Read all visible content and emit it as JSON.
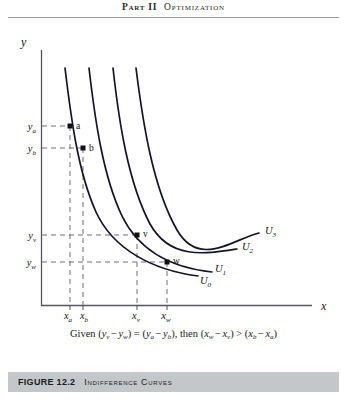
{
  "running_head": {
    "part": "Part II",
    "chapter": "Optimization"
  },
  "figure": {
    "axis_label_x": "x",
    "axis_label_y": "y",
    "y_ticks": [
      {
        "id": "ya",
        "base": "y",
        "sub": "a",
        "py": 126
      },
      {
        "id": "yb",
        "base": "y",
        "sub": "b",
        "py": 148
      },
      {
        "id": "yv",
        "base": "y",
        "sub": "v",
        "py": 235
      },
      {
        "id": "yw",
        "base": "y",
        "sub": "w",
        "py": 262
      }
    ],
    "x_ticks": [
      {
        "id": "xa",
        "base": "x",
        "sub": "a",
        "px": 70
      },
      {
        "id": "xb",
        "base": "x",
        "sub": "b",
        "px": 83
      },
      {
        "id": "xv",
        "base": "x",
        "sub": "v",
        "px": 137
      },
      {
        "id": "xw",
        "base": "x",
        "sub": "w",
        "px": 167
      }
    ],
    "points": [
      {
        "id": "a",
        "label": "a",
        "px": 70,
        "py": 126
      },
      {
        "id": "b",
        "label": "b",
        "px": 83,
        "py": 148
      },
      {
        "id": "v",
        "label": "v",
        "px": 137,
        "py": 235
      },
      {
        "id": "w",
        "label": "w",
        "px": 167,
        "py": 262
      }
    ],
    "curves": [
      {
        "id": "U0",
        "base": "U",
        "sub": "0",
        "label_px": 200,
        "label_py": 270
      },
      {
        "id": "U1",
        "base": "U",
        "sub": "1",
        "label_px": 214,
        "label_py": 256
      },
      {
        "id": "U2",
        "base": "U",
        "sub": "2",
        "label_px": 240,
        "label_py": 245
      },
      {
        "id": "U3",
        "base": "U",
        "sub": "3",
        "label_px": 262,
        "label_py": 230
      }
    ]
  },
  "equation": {
    "given_word": "Given",
    "lhs_open": "(",
    "lhs_1_base": "y",
    "lhs_1_sub": "v",
    "minus_1": "−",
    "lhs_2_base": "y",
    "lhs_2_sub": "w",
    "lhs_close": ")",
    "equals": "=",
    "rhs_open": "(",
    "rhs_1_base": "y",
    "rhs_1_sub": "a",
    "minus_2": "−",
    "rhs_2_base": "y",
    "rhs_2_sub": "b",
    "rhs_close": ")",
    "then_word": ", then",
    "t1_open": "(",
    "t1_1_base": "x",
    "t1_1_sub": "w",
    "minus_3": "−",
    "t1_2_base": "x",
    "t1_2_sub": "v",
    "t1_close": ")",
    "greater": ">",
    "t2_open": "(",
    "t2_1_base": "x",
    "t2_1_sub": "b",
    "minus_4": "−",
    "t2_2_base": "x",
    "t2_2_sub": "a",
    "t2_close": ")",
    "full_text": "Given (y_v − y_w) = (y_a − y_b), then (x_w − x_v) > (x_b − x_a)"
  },
  "caption": {
    "number": "FIGURE 12.2",
    "title": "Indifference Curves"
  },
  "colors": {
    "ink": "#1a1a1a",
    "axis": "#55555c",
    "curve": "#14142a",
    "dashed": "#6e6e78",
    "caption_bar": "#c3c7c9",
    "rule": "#9a9a9a",
    "page": "#ffffff"
  }
}
